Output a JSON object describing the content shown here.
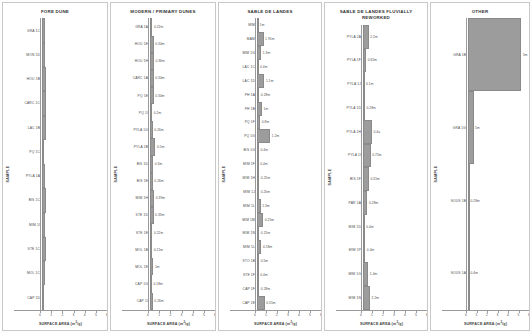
{
  "figure": {
    "axis": {
      "x_label": "SURFACE AREA (m2/g)",
      "x_label_pre": "SURFACE AREA (m",
      "x_label_sup": "2",
      "x_label_post": "/g)",
      "y_label": "SAMPLE",
      "x_ticks": [
        "0",
        "1",
        "2",
        "3",
        "4",
        "5",
        "6"
      ],
      "x_min": 0,
      "x_max": 6
    },
    "bar_color": "#9c9c9c",
    "bar_edge_color": "#8a8a8a",
    "panel_border_color": "#c9c9c9"
  },
  "chart_data": [
    {
      "type": "bar",
      "title": "FORE DUNE",
      "xlabel": "SURFACE AREA (m2/g)",
      "ylabel": "SAMPLE",
      "xlim": [
        0,
        6
      ],
      "grid": false,
      "legend": "none",
      "orientation": "horizontal",
      "categories": [
        "GRA 1C",
        "MON 1D",
        "HOU 1B",
        "CARC 1C",
        "LAC 1B",
        "PQ 1C",
        "PYLA 1A",
        "BIS 1C",
        "MIM 1I",
        "STE 1C",
        "MOL 1C",
        "CAP 1D"
      ],
      "values": [
        0.31,
        0.28,
        0.36,
        0.34,
        0.33,
        0.18,
        0.26,
        0.37,
        0.27,
        0.33,
        0.29,
        0.22
      ],
      "value_labels": [
        "",
        "",
        "",
        "",
        "",
        "",
        "",
        "",
        "",
        "",
        "",
        ""
      ]
    },
    {
      "type": "bar",
      "title": "MODERN / PRIMARY DUNES",
      "xlabel": "SURFACE AREA (m2/g)",
      "ylabel": "SAMPLE",
      "xlim": [
        0,
        6
      ],
      "grid": false,
      "legend": "none",
      "orientation": "horizontal",
      "categories": [
        "GRA 1A",
        "HOU 1E",
        "HOU 1H",
        "CARC 1A",
        "PQ 1E",
        "PQ 1I",
        "PYLA 1G",
        "PYLA 1B",
        "BIS 1D",
        "BIS 1E",
        "MIM 1H",
        "STE 1D",
        "STE 1E",
        "MOL 1B",
        "MOL 1E",
        "CAP 1G",
        "CAP 1I"
      ],
      "values": [
        0.22,
        0.34,
        0.36,
        0.34,
        0.34,
        0.2,
        0.26,
        0.5,
        0.3,
        0.26,
        0.39,
        0.33,
        0.22,
        0.21,
        0.32,
        0.18,
        0.26
      ],
      "value_labels": [
        "0.22m",
        "0.34m",
        "0.36m",
        "0.34m",
        "0.34m",
        "0.2m",
        "0.26m",
        "0.5m",
        "0.3m",
        "0.26m",
        "0.39m",
        "0.33m",
        "0.22m",
        "0.21m",
        "1m",
        "0.18m",
        "0.26m"
      ]
    },
    {
      "type": "bar",
      "title": "SABLE DE LANDES",
      "xlabel": "SURFACE AREA (m2/g)",
      "ylabel": "SAMPLE",
      "xlim": [
        0,
        6
      ],
      "grid": false,
      "legend": "none",
      "orientation": "horizontal",
      "categories": [
        "MIM",
        "MAM",
        "MIM 1G",
        "LAC 1C",
        "LAC 1D",
        "PH 1A",
        "PH 1B",
        "PQ 1F",
        "PQ 1G",
        "BIS 1G",
        "MIM 1F",
        "MIM 1H",
        "MIM 1J",
        "MIM 1L",
        "MIM 1M",
        "MIM 1N",
        "MIM 1L",
        "STO 1B",
        "STE 1F",
        "CAP 1F",
        "CAP 1E"
      ],
      "values": [
        0.12,
        0.62,
        0.4,
        0.14,
        0.7,
        0.22,
        0.48,
        0.3,
        1.25,
        0.18,
        0.16,
        0.22,
        0.2,
        0.35,
        0.58,
        0.22,
        0.42,
        0.2,
        0.16,
        0.22,
        0.72
      ],
      "value_labels": [
        "1m",
        "1.95m",
        "1.3m",
        "0.4m",
        "1.1m",
        "0.28m",
        "1m",
        "0.8m",
        "1.2m",
        "0.4m",
        "0.4m",
        "0.25m",
        "0.20m",
        "1.3m",
        "0.25m",
        "0.25m",
        "0.58m",
        "0.5m",
        "0.4m",
        "0.28m",
        "0.55m"
      ]
    },
    {
      "type": "bar",
      "title": "SABLE DE LANDES FLUVIALLY REWORKED",
      "title_lines": [
        "SABLE DE LANDES FLUVIALLY",
        "REWORKED"
      ],
      "xlabel": "SURFACE AREA (m2/g)",
      "ylabel": "SAMPLE",
      "xlim": [
        0,
        6
      ],
      "grid": false,
      "legend": "none",
      "orientation": "horizontal",
      "categories": [
        "PYLA 2A",
        "PYLA 1F",
        "PYLA 1J",
        "PYLA 1D",
        "PYLA 1H",
        "PYLA 1I",
        "BIS 1F",
        "PAR 1A",
        "MIM 1D",
        "MIM 1P",
        "MIM 1G",
        "MIM 1N"
      ],
      "values": [
        0.54,
        0.3,
        0.14,
        0.18,
        0.84,
        0.72,
        0.56,
        0.42,
        0.16,
        0.22,
        0.5,
        0.66
      ],
      "value_labels": [
        "2.2m",
        "0.65m",
        "0.1m",
        "0.28m",
        "0.4a",
        "0.75m",
        "0.55m",
        "0.28m",
        "0.4m",
        "0.4m",
        "1.4m",
        "2.2m"
      ]
    },
    {
      "type": "bar",
      "title": "OTHER",
      "xlabel": "SURFACE AREA (m2/g)",
      "ylabel": "SAMPLE",
      "xlim": [
        0,
        6
      ],
      "grid": false,
      "legend": "none",
      "orientation": "horizontal",
      "categories": [
        "GRA 1B",
        "GRA 1G",
        "SOUS 1B",
        "SOUS 1A"
      ],
      "values": [
        5.25,
        0.55,
        0.09,
        0.09
      ],
      "value_labels": [
        "5m",
        "5m",
        "0.28m",
        "0.4m"
      ]
    }
  ]
}
